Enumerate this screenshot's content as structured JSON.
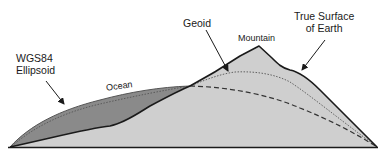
{
  "diagram": {
    "labels": {
      "wgs84_line1": "WGS84",
      "wgs84_line2": "Ellipsoid",
      "geoid": "Geoid",
      "mountain": "Mountain",
      "true_surface_line1": "True Surface",
      "true_surface_line2": "of Earth",
      "ocean": "Ocean"
    },
    "colors": {
      "ocean_fill": "#8a8a8a",
      "land_fill": "#cfcfcf",
      "outline": "#1a1a1a",
      "ellipsoid_dash": "#333333",
      "geoid_dot": "#555555",
      "text": "#1a1a1a"
    }
  }
}
